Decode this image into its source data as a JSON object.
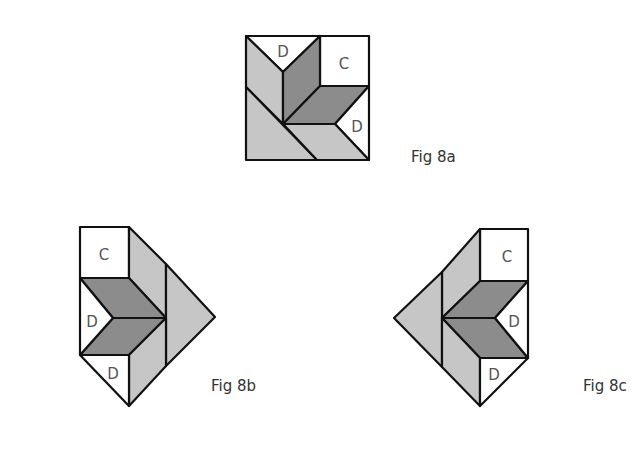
{
  "colors": {
    "white": "#ffffff",
    "light_gray": "#c6c6c6",
    "dark_gray": "#8c8c8c",
    "stroke": "#111111",
    "label": "#555555"
  },
  "figures": [
    {
      "id": "fig-8a",
      "caption": "Fig 8a",
      "caption_pos": [
        411,
        148
      ],
      "pieces": [
        {
          "name": "top-d-triangle",
          "fill": "white",
          "points": [
            [
              246,
              36
            ],
            [
              320,
              36
            ],
            [
              283,
              72
            ]
          ],
          "label": "D",
          "label_pos": [
            283,
            52
          ]
        },
        {
          "name": "c-square",
          "fill": "white",
          "points": [
            [
              320,
              36
            ],
            [
              369,
              36
            ],
            [
              369,
              86
            ],
            [
              320,
              86
            ]
          ],
          "label": "C",
          "label_pos": [
            344,
            64
          ]
        },
        {
          "name": "upper-left-light-strip",
          "fill": "light_gray",
          "points": [
            [
              246,
              36
            ],
            [
              283,
              72
            ],
            [
              283,
              124
            ],
            [
              246,
              87
            ]
          ]
        },
        {
          "name": "lower-left-light-triangle",
          "fill": "light_gray",
          "points": [
            [
              246,
              87
            ],
            [
              317,
              160
            ],
            [
              246,
              160
            ]
          ]
        },
        {
          "name": "left-dark-diamond",
          "fill": "dark_gray",
          "points": [
            [
              283,
              72
            ],
            [
              320,
              36
            ],
            [
              320,
              86
            ],
            [
              283,
              124
            ]
          ]
        },
        {
          "name": "right-dark-diamond",
          "fill": "dark_gray",
          "points": [
            [
              283,
              124
            ],
            [
              320,
              86
            ],
            [
              369,
              86
            ],
            [
              335,
              124
            ]
          ]
        },
        {
          "name": "right-d-triangle",
          "fill": "white",
          "points": [
            [
              369,
              86
            ],
            [
              335,
              124
            ],
            [
              369,
              160
            ]
          ],
          "label": "D",
          "label_pos": [
            357,
            127
          ]
        },
        {
          "name": "bottom-light-strip",
          "fill": "light_gray",
          "points": [
            [
              283,
              124
            ],
            [
              335,
              124
            ],
            [
              369,
              160
            ],
            [
              317,
              160
            ]
          ]
        }
      ]
    },
    {
      "id": "fig-8b",
      "caption": "Fig 8b",
      "caption_pos": [
        211,
        377
      ],
      "pieces": [
        {
          "name": "c-square",
          "fill": "white",
          "points": [
            [
              80,
              227
            ],
            [
              129,
              227
            ],
            [
              129,
              278
            ],
            [
              80,
              278
            ]
          ],
          "label": "C",
          "label_pos": [
            104,
            255
          ]
        },
        {
          "name": "upper-light-strip",
          "fill": "light_gray",
          "points": [
            [
              129,
              227
            ],
            [
              166,
              264
            ],
            [
              166,
              318
            ],
            [
              129,
              278
            ]
          ]
        },
        {
          "name": "right-light-triangle",
          "fill": "light_gray",
          "points": [
            [
              166,
              264
            ],
            [
              215,
              317
            ],
            [
              166,
              366
            ]
          ]
        },
        {
          "name": "upper-dark-diamond",
          "fill": "dark_gray",
          "points": [
            [
              80,
              278
            ],
            [
              129,
              278
            ],
            [
              166,
              318
            ],
            [
              113,
              318
            ]
          ]
        },
        {
          "name": "lower-dark-diamond",
          "fill": "dark_gray",
          "points": [
            [
              113,
              318
            ],
            [
              166,
              318
            ],
            [
              129,
              355
            ],
            [
              80,
              355
            ]
          ]
        },
        {
          "name": "left-d-triangle",
          "fill": "white",
          "points": [
            [
              80,
              278
            ],
            [
              113,
              318
            ],
            [
              80,
              355
            ]
          ],
          "label": "D",
          "label_pos": [
            92,
            322
          ]
        },
        {
          "name": "lower-light-strip",
          "fill": "light_gray",
          "points": [
            [
              129,
              355
            ],
            [
              166,
              318
            ],
            [
              166,
              366
            ],
            [
              129,
              406
            ]
          ]
        },
        {
          "name": "bottom-d-triangle",
          "fill": "white",
          "points": [
            [
              80,
              355
            ],
            [
              129,
              355
            ],
            [
              129,
              406
            ]
          ],
          "label": "D",
          "label_pos": [
            113,
            374
          ]
        }
      ]
    },
    {
      "id": "fig-8c",
      "caption": "Fig 8c",
      "caption_pos": [
        583,
        377
      ],
      "pieces": [
        {
          "name": "c-square",
          "fill": "white",
          "points": [
            [
              480,
              229
            ],
            [
              528,
              229
            ],
            [
              528,
              281
            ],
            [
              480,
              281
            ]
          ],
          "label": "C",
          "label_pos": [
            507,
            257
          ]
        },
        {
          "name": "upper-light-strip",
          "fill": "light_gray",
          "points": [
            [
              480,
              229
            ],
            [
              480,
              281
            ],
            [
              442,
              318
            ],
            [
              442,
              272
            ]
          ]
        },
        {
          "name": "left-light-triangle",
          "fill": "light_gray",
          "points": [
            [
              442,
              272
            ],
            [
              394,
              318
            ],
            [
              442,
              367
            ]
          ]
        },
        {
          "name": "upper-dark-diamond",
          "fill": "dark_gray",
          "points": [
            [
              480,
              281
            ],
            [
              528,
              281
            ],
            [
              495,
              318
            ],
            [
              442,
              318
            ]
          ]
        },
        {
          "name": "lower-dark-diamond",
          "fill": "dark_gray",
          "points": [
            [
              442,
              318
            ],
            [
              495,
              318
            ],
            [
              528,
              358
            ],
            [
              480,
              358
            ]
          ]
        },
        {
          "name": "right-d-triangle",
          "fill": "white",
          "points": [
            [
              528,
              281
            ],
            [
              528,
              358
            ],
            [
              495,
              318
            ]
          ],
          "label": "D",
          "label_pos": [
            514,
            322
          ]
        },
        {
          "name": "lower-light-strip",
          "fill": "light_gray",
          "points": [
            [
              442,
              318
            ],
            [
              480,
              358
            ],
            [
              480,
              406
            ],
            [
              442,
              367
            ]
          ]
        },
        {
          "name": "bottom-d-triangle",
          "fill": "white",
          "points": [
            [
              480,
              358
            ],
            [
              528,
              358
            ],
            [
              480,
              406
            ]
          ],
          "label": "D",
          "label_pos": [
            494,
            375
          ]
        }
      ]
    }
  ]
}
